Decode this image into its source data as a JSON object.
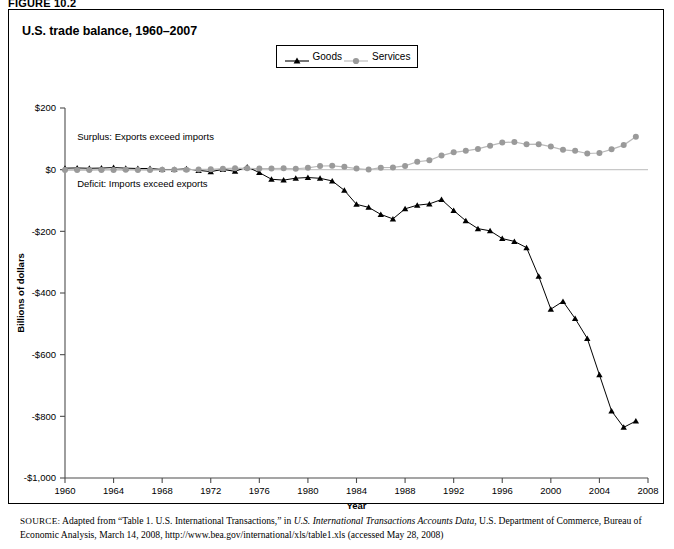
{
  "figure": {
    "label": "FIGURE 10.2",
    "title": "U.S. trade balance, 1960–2007"
  },
  "legend": {
    "items": [
      {
        "label": "Goods",
        "marker": "triangle-marker-icon",
        "color": "#000000"
      },
      {
        "label": "Services",
        "marker": "circle-marker-icon",
        "color": "#9a9a9a"
      }
    ]
  },
  "annotations": [
    {
      "text": "Surplus: Exports exceed imports",
      "x": 1961.0,
      "y": 95
    },
    {
      "text": "Deficit: Imports exceed exports",
      "x": 1961.0,
      "y": -55
    }
  ],
  "source": {
    "prefix": "SOURCE:",
    "line1_a": " Adapted from “Table 1. U.S. International Transactions,” in ",
    "line1_italic": "U.S. International Transactions Accounts Data",
    "line1_b": ", U.S. Department of Commerce,",
    "line2": "Bureau of Economic Analysis, March 14, 2008, http://www.bea.gov/international/xls/table1.xls (accessed May 28, 2008)"
  },
  "chart_data": {
    "type": "line",
    "title": "U.S. trade balance, 1960–2007",
    "xlabel": "Year",
    "ylabel": "Billions of dollars",
    "xlim": [
      1960,
      2008
    ],
    "ylim": [
      -1000,
      200
    ],
    "grid": false,
    "legend_position": "top-center",
    "x_ticks": [
      1960,
      1964,
      1968,
      1972,
      1976,
      1980,
      1984,
      1988,
      1992,
      1996,
      2000,
      2004,
      2008
    ],
    "y_ticks": [
      200,
      0,
      -200,
      -400,
      -600,
      -800,
      -1000
    ],
    "y_tick_labels": [
      "$200",
      "$0",
      "-$200",
      "-$400",
      "-$600",
      "-$800",
      "-$1,000"
    ],
    "x": [
      1960,
      1961,
      1962,
      1963,
      1964,
      1965,
      1966,
      1967,
      1968,
      1969,
      1970,
      1971,
      1972,
      1973,
      1974,
      1975,
      1976,
      1977,
      1978,
      1979,
      1980,
      1981,
      1982,
      1983,
      1984,
      1985,
      1986,
      1987,
      1988,
      1989,
      1990,
      1991,
      1992,
      1993,
      1994,
      1995,
      1996,
      1997,
      1998,
      1999,
      2000,
      2001,
      2002,
      2003,
      2004,
      2005,
      2006,
      2007
    ],
    "series": [
      {
        "name": "Goods",
        "color": "#000000",
        "marker": "triangle",
        "values": [
          4.9,
          5.6,
          4.5,
          5.2,
          6.8,
          5.0,
          3.8,
          3.8,
          0.6,
          0.6,
          2.6,
          -2.3,
          -6.4,
          0.9,
          -5.5,
          8.9,
          -9.5,
          -31.1,
          -33.9,
          -27.6,
          -25.5,
          -28.0,
          -36.5,
          -67.1,
          -112.5,
          -122.2,
          -145.1,
          -159.6,
          -127.0,
          -115.2,
          -111.0,
          -96.9,
          -132.5,
          -165.8,
          -191.3,
          -198.4,
          -223.5,
          -232.6,
          -252.9,
          -346.0,
          -452.4,
          -427.2,
          -482.9,
          -547.3,
          -665.4,
          -782.7,
          -835.7,
          -815.4
        ]
      },
      {
        "name": "Services",
        "color": "#9a9a9a",
        "marker": "circle",
        "values": [
          -1.4,
          -1.4,
          -1.2,
          -1.0,
          -0.8,
          -0.3,
          -0.9,
          -1.2,
          -0.4,
          -0.5,
          -0.3,
          0.9,
          1.0,
          3.3,
          5.0,
          4.3,
          3.5,
          3.8,
          4.2,
          3.0,
          6.1,
          11.9,
          12.3,
          9.3,
          3.4,
          0.3,
          6.6,
          7.4,
          12.2,
          25.7,
          30.2,
          45.8,
          56.2,
          61.2,
          67.3,
          77.8,
          87.8,
          89.8,
          82.1,
          82.7,
          74.9,
          64.4,
          61.2,
          52.4,
          54.1,
          66.0,
          79.7,
          106.9
        ]
      }
    ]
  }
}
